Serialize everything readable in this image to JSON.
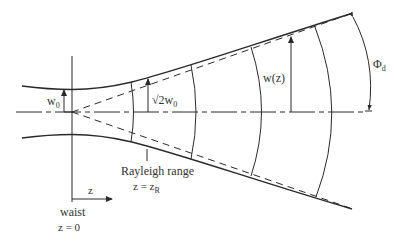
{
  "diagram": {
    "colors": {
      "line": "#2a2a2a",
      "text": "#333333",
      "background": "#ffffff"
    },
    "labels": {
      "w0_main": "w",
      "w0_sub": "0",
      "sqrt2w0_radical": "√",
      "sqrt2w0_main": "2w",
      "sqrt2w0_sub": "0",
      "wz": "w(z)",
      "phi_main": "Φ",
      "phi_sub": "d",
      "rayleigh_title": "Rayleigh range",
      "rayleigh_eq_main": "z = z",
      "rayleigh_eq_sub": "R",
      "z_axis": "z",
      "waist_title": "waist",
      "waist_eq": "z = 0"
    },
    "elements": [
      "optical-axis (dash-dot)",
      "waist-line (vertical)",
      "beam-envelope-top (hyperbola)",
      "beam-envelope-bottom (hyperbola)",
      "asymptote-top (dashed)",
      "asymptote-bottom (dashed)",
      "wavefront-arcs x4",
      "w0 arrow",
      "sqrt2 w0 arrow",
      "w(z) arrow",
      "divergence-angle arc arrow",
      "z direction arrow"
    ]
  }
}
